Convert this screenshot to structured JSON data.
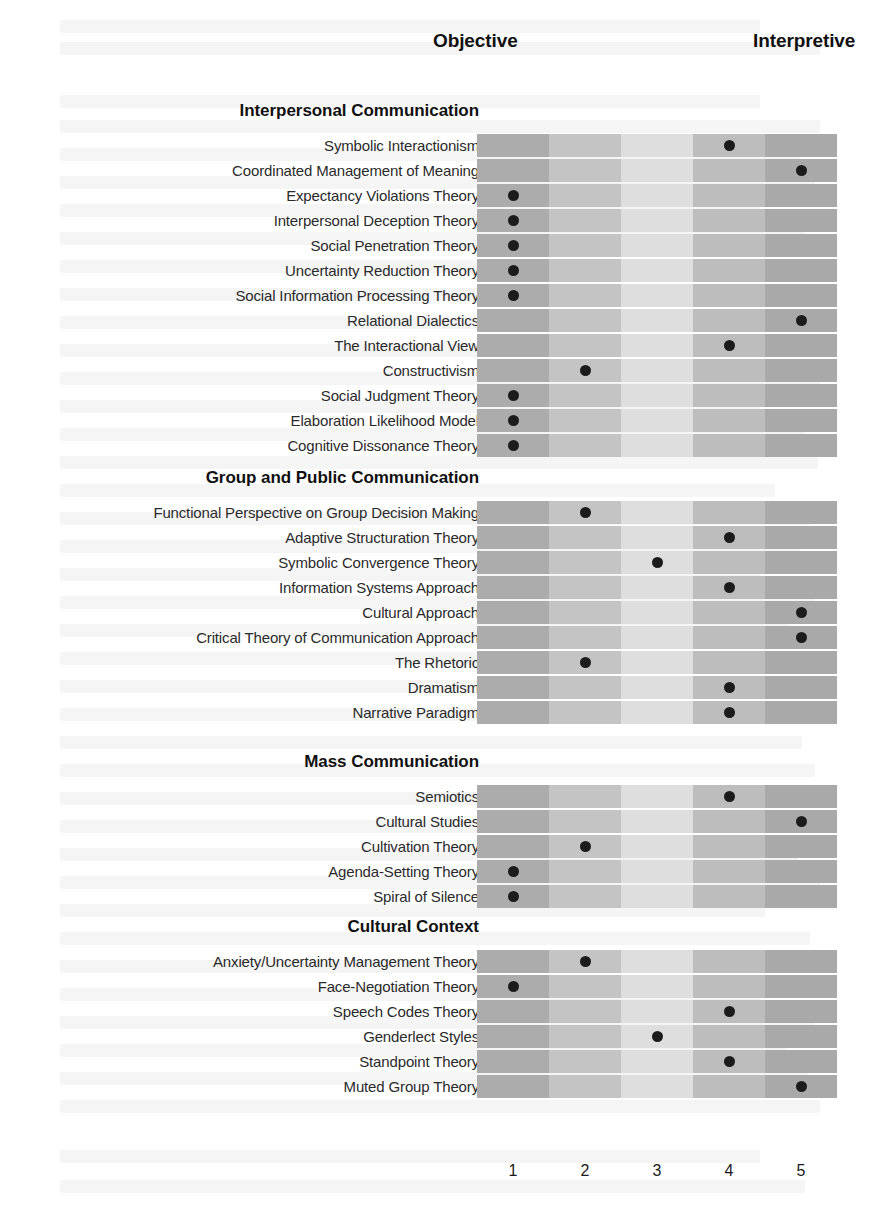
{
  "header": {
    "objective_label": "Objective",
    "interpretive_label": "Interpretive"
  },
  "scale": {
    "ticks": [
      "1",
      "2",
      "3",
      "4",
      "5"
    ],
    "min": 1,
    "max": 5,
    "column_colors": [
      "#acacac",
      "#c4c4c4",
      "#dedede",
      "#bdbdbd",
      "#a9a9a9"
    ],
    "dot_color": "#1c1c1c"
  },
  "chart_data": {
    "type": "scatter",
    "title": "",
    "subtitle": "",
    "xlabel": "",
    "ylabel": "",
    "xlim": [
      1,
      5
    ],
    "grid": true,
    "legend": false,
    "x_axis_endpoints": {
      "left": "Objective",
      "right": "Interpretive"
    },
    "x_tick_labels": [
      "1",
      "2",
      "3",
      "4",
      "5"
    ],
    "sections": [
      {
        "name": "Interpersonal Communication",
        "rows": [
          {
            "label": "Symbolic Interactionism",
            "value": 4
          },
          {
            "label": "Coordinated Management of Meaning",
            "value": 5
          },
          {
            "label": "Expectancy Violations Theory",
            "value": 1
          },
          {
            "label": "Interpersonal Deception Theory",
            "value": 1
          },
          {
            "label": "Social Penetration Theory",
            "value": 1
          },
          {
            "label": "Uncertainty Reduction Theory",
            "value": 1
          },
          {
            "label": "Social Information Processing Theory",
            "value": 1
          },
          {
            "label": "Relational Dialectics",
            "value": 5
          },
          {
            "label": "The Interactional View",
            "value": 4
          },
          {
            "label": "Constructivism",
            "value": 2
          },
          {
            "label": "Social Judgment Theory",
            "value": 1
          },
          {
            "label": "Elaboration Likelihood Model",
            "value": 1
          },
          {
            "label": "Cognitive Dissonance Theory",
            "value": 1
          }
        ]
      },
      {
        "name": "Group and Public Communication",
        "rows": [
          {
            "label": "Functional Perspective on Group Decision Making",
            "value": 2
          },
          {
            "label": "Adaptive Structuration Theory",
            "value": 4
          },
          {
            "label": "Symbolic Convergence Theory",
            "value": 3
          },
          {
            "label": "Information Systems Approach",
            "value": 4
          },
          {
            "label": "Cultural Approach",
            "value": 5
          },
          {
            "label": "Critical Theory of Communication Approach",
            "value": 5
          },
          {
            "label": "The Rhetoric",
            "value": 2
          },
          {
            "label": "Dramatism",
            "value": 4
          },
          {
            "label": "Narrative Paradigm",
            "value": 4
          }
        ]
      },
      {
        "name": "Mass Communication",
        "rows": [
          {
            "label": "Semiotics",
            "value": 4
          },
          {
            "label": "Cultural Studies",
            "value": 5
          },
          {
            "label": "Cultivation Theory",
            "value": 2
          },
          {
            "label": "Agenda-Setting Theory",
            "value": 1
          },
          {
            "label": "Spiral of Silence",
            "value": 1
          }
        ]
      },
      {
        "name": "Cultural Context",
        "rows": [
          {
            "label": "Anxiety/Uncertainty Management Theory",
            "value": 2
          },
          {
            "label": "Face-Negotiation Theory",
            "value": 1
          },
          {
            "label": "Speech Codes Theory",
            "value": 4
          },
          {
            "label": "Genderlect Styles",
            "value": 3
          },
          {
            "label": "Standpoint Theory",
            "value": 4
          },
          {
            "label": "Muted Group Theory",
            "value": 5
          }
        ]
      }
    ]
  }
}
